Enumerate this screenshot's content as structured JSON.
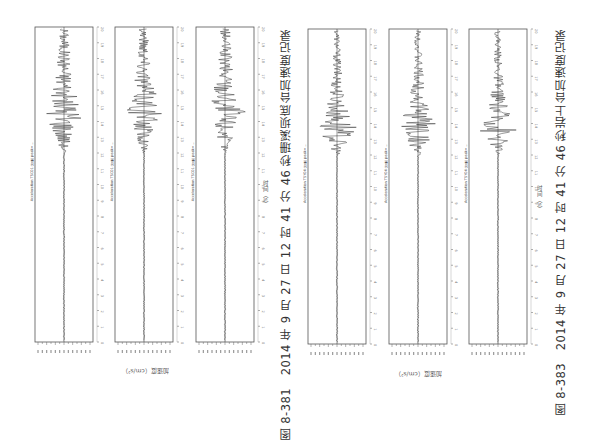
{
  "chart_data": [
    {
      "type": "line",
      "figure": "图 8-381",
      "title": "2014 年 9 月 27 日 12 时 41 分 46 秒珊溪坝底台加速度记录",
      "xlabel": "时间（s）",
      "ylabel": "加速度（cm/s²）",
      "orientation": "rotated 90° (time axis vertical, bottom-to-top)",
      "xlim": [
        0,
        20
      ],
      "x_ticks": [
        0,
        1,
        2,
        3,
        4,
        5,
        6,
        7,
        8,
        9,
        10,
        11,
        12,
        13,
        14,
        15,
        16,
        17,
        18,
        19,
        20
      ],
      "series": [
        {
          "name": "Acceleration 分量1",
          "peak_time_s": 14.3,
          "relative_peak": 0.75
        },
        {
          "name": "Acceleration 分量2",
          "peak_time_s": 14.6,
          "relative_peak": 0.65
        },
        {
          "name": "Acceleration 分量3",
          "peak_time_s": 14.6,
          "relative_peak": 0.7
        }
      ]
    },
    {
      "type": "line",
      "figure": "图 8-383",
      "title": "2014 年 9 月 27 日 12 时 41 分 46 秒岩上台加速度记录",
      "xlabel": "时间（s）",
      "ylabel": "加速度（cm/s²）",
      "orientation": "rotated 90° (time axis vertical, bottom-to-top)",
      "xlim": [
        0,
        20
      ],
      "x_ticks": [
        0,
        1,
        2,
        3,
        4,
        5,
        6,
        7,
        8,
        9,
        10,
        11,
        12,
        13,
        14,
        15,
        16,
        17,
        18,
        19,
        20
      ],
      "series": [
        {
          "name": "Acceleration 分量1",
          "peak_time_s": 13.7,
          "relative_peak": 0.8
        },
        {
          "name": "Acceleration 分量2",
          "peak_time_s": 13.8,
          "relative_peak": 0.85
        },
        {
          "name": "Acceleration 分量3",
          "peak_time_s": 13.7,
          "relative_peak": 0.72
        }
      ]
    }
  ],
  "groups": [
    {
      "caption": "图 8-381　2014 年 9 月 27 日 12 时 41 分 46 秒珊溪坝底台加速度记录",
      "ylabel": "加速度（cm/s²）",
      "xlabel": "时间（s）",
      "panels": [
        {
          "title": "Acceleration TSC01 分量 peak=…"
        },
        {
          "title": "Acceleration TSC01 分量 peak=…"
        },
        {
          "title": "Acceleration TSC01 分量 peak=…"
        }
      ]
    },
    {
      "caption": "图 8-383　2014 年 9 月 27 日 12 时 41 分 46 秒岩上台加速度记录",
      "ylabel": "加速度（cm/s²）",
      "xlabel": "时间（s）",
      "panels": [
        {
          "title": "Acceleration TSY04 分量 peak=…"
        },
        {
          "title": "Acceleration TSY04 分量 peak=…"
        },
        {
          "title": "Acceleration TSY04 分量 peak=…"
        }
      ]
    }
  ],
  "colors": {
    "trace": "#222222",
    "axis": "#555555",
    "background": "#ffffff"
  }
}
